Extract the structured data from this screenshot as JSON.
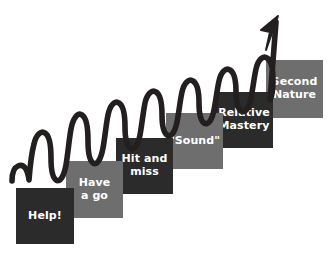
{
  "diagram": {
    "background_color": "#ffffff",
    "wave_color": "#231f1f",
    "text_color": "#ffffff",
    "tone_dark": "#2b2b2b",
    "tone_light": "#6e6e6e",
    "arrow": {
      "name": "progress-arrow",
      "direction": "up-right",
      "tip_x": 276,
      "tip_y": 19
    },
    "steps": [
      {
        "label": "Help!",
        "tone": "dark",
        "x": 16,
        "y": 188,
        "w": 58,
        "h": 56
      },
      {
        "label": "Have\na go",
        "tone": "light",
        "x": 66,
        "y": 161,
        "w": 57,
        "h": 57
      },
      {
        "label": "Hit and\nmiss",
        "tone": "dark",
        "x": 116,
        "y": 138,
        "w": 57,
        "h": 56
      },
      {
        "label": "\"Sound\"",
        "tone": "light",
        "x": 166,
        "y": 113,
        "w": 57,
        "h": 56
      },
      {
        "label": "Relative\nMastery",
        "tone": "dark",
        "x": 215,
        "y": 92,
        "w": 58,
        "h": 56
      },
      {
        "label": "Second\nNature",
        "tone": "light",
        "x": 266,
        "y": 60,
        "w": 57,
        "h": 58
      }
    ]
  }
}
